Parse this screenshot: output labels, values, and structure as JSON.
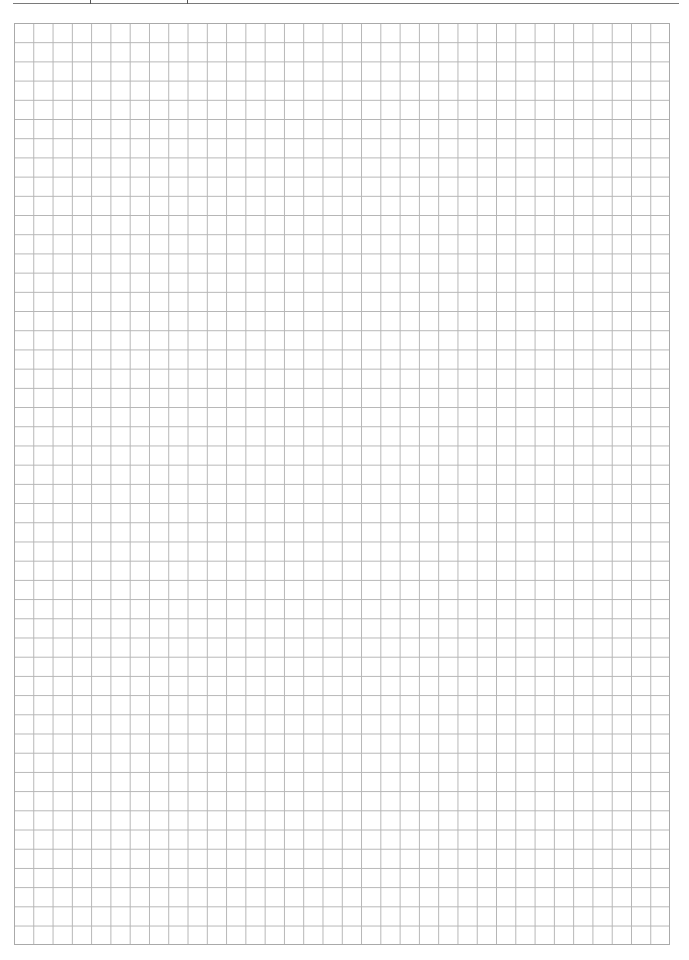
{
  "page": {
    "type": "graph-paper",
    "grid": {
      "columns": 34,
      "rows": 48,
      "line_color": "#b5b5b5",
      "border_color": "#aaaaaa"
    },
    "header_rule": {
      "color": "#7a7a7a",
      "ticks": 2
    }
  }
}
